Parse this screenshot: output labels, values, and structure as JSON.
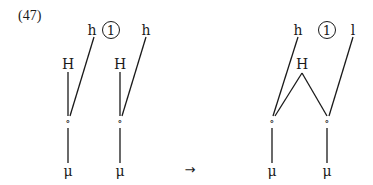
{
  "example_number": "(47)",
  "left": {
    "tree1": {
      "tone_top": "h",
      "circled": "1",
      "H": "H",
      "node": "∘",
      "mora": "μ"
    },
    "tree2": {
      "tone_top": "h",
      "H": "H",
      "node": "∘",
      "mora": "μ"
    }
  },
  "arrow": "→",
  "right": {
    "tone_left": "h",
    "circled": "1",
    "tone_right": "l",
    "H": "H",
    "node1": "∘",
    "node2": "∘",
    "mora1": "μ",
    "mora2": "μ"
  }
}
